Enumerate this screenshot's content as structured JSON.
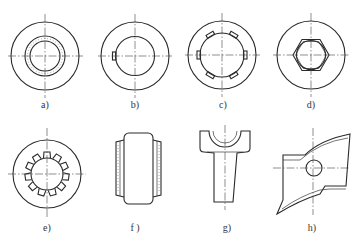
{
  "figure": {
    "colors": {
      "line": "#2a2a2a",
      "background": "#ffffff"
    },
    "panels": [
      {
        "id": "a",
        "label": "a)",
        "shape": "ring-with-dotted-inner-ring"
      },
      {
        "id": "b",
        "label": "b)",
        "shape": "ring-with-key"
      },
      {
        "id": "c",
        "label": "c)",
        "shape": "ring-with-six-tabs"
      },
      {
        "id": "d",
        "label": "d)",
        "shape": "ring-with-hexagon"
      },
      {
        "id": "e",
        "label": "e)",
        "shape": "ring-with-spline-teeth"
      },
      {
        "id": "f",
        "label": "f )",
        "shape": "bushing-side-view"
      },
      {
        "id": "g",
        "label": "g)",
        "shape": "fork-yoke"
      },
      {
        "id": "h",
        "label": "h)",
        "shape": "curved-blade-with-hole"
      }
    ]
  }
}
